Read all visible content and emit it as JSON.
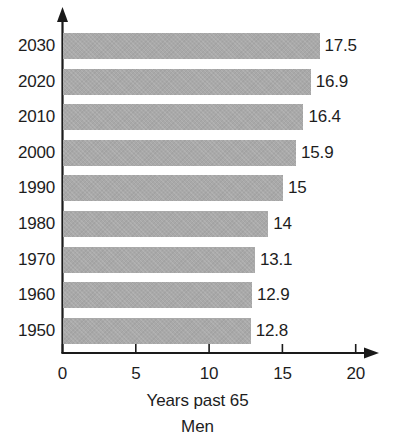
{
  "chart_data": {
    "type": "bar",
    "orientation": "horizontal",
    "title": "",
    "xlabel": "Years past 65",
    "sublabel": "Men",
    "ylabel": "",
    "categories": [
      "2030",
      "2020",
      "2010",
      "2000",
      "1990",
      "1980",
      "1970",
      "1960",
      "1950"
    ],
    "values": [
      17.5,
      16.9,
      16.4,
      15.9,
      15,
      14,
      13.1,
      12.9,
      12.8
    ],
    "value_labels": [
      "17.5",
      "16.9",
      "16.4",
      "15.9",
      "15",
      "14",
      "13.1",
      "12.9",
      "12.8"
    ],
    "xlim": [
      0,
      20
    ],
    "xticks": [
      0,
      5,
      10,
      15,
      20
    ],
    "xtick_labels": [
      "0",
      "5",
      "10",
      "15",
      "20"
    ],
    "grid": false,
    "legend": null,
    "bar_color": "#a9a9a9",
    "axis_color": "#1a1a1a",
    "text_color": "#1d1d1d",
    "background": "#ffffff"
  }
}
